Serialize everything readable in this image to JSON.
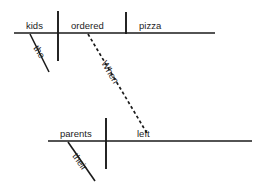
{
  "diagram": {
    "sentence": "When the kids ordered pizza their parents left.",
    "ink_color": "#1a1a1a",
    "background_color": "#ffffff",
    "clauses": [
      {
        "id": "subordinate-clause",
        "baseline": {
          "x1": 14,
          "y1": 33,
          "x2": 215,
          "y2": 33
        },
        "words": [
          {
            "id": "subject",
            "label": "kids",
            "role": "subject",
            "x": 26,
            "y": 29
          },
          {
            "id": "verb",
            "label": "ordered",
            "role": "verb",
            "x": 71,
            "y": 29
          },
          {
            "id": "direct-object",
            "label": "pizza",
            "role": "direct object",
            "x": 139,
            "y": 29
          },
          {
            "id": "article-modifier",
            "label": "the",
            "role": "article modifying subject",
            "x": 33,
            "y": 48,
            "rotation": 57
          }
        ],
        "dividers": [
          {
            "id": "subject-verb-divider",
            "x1": 58,
            "y1": 11,
            "x2": 58,
            "y2": 61
          },
          {
            "id": "verb-object-divider",
            "x1": 126,
            "y1": 12,
            "x2": 126,
            "y2": 34
          }
        ],
        "modifier_lines": [
          {
            "id": "the-slant",
            "x1": 30,
            "y1": 34,
            "x2": 49,
            "y2": 72
          }
        ]
      },
      {
        "id": "main-clause",
        "baseline": {
          "x1": 48,
          "y1": 141,
          "x2": 252,
          "y2": 141
        },
        "words": [
          {
            "id": "subject",
            "label": "parents",
            "role": "subject",
            "x": 60,
            "y": 137
          },
          {
            "id": "verb",
            "label": "left",
            "role": "verb",
            "x": 137,
            "y": 137
          },
          {
            "id": "possessive-modifier",
            "label": "their",
            "role": "possessive adjective modifying subject",
            "x": 72,
            "y": 156,
            "rotation": 55
          }
        ],
        "dividers": [
          {
            "id": "subject-verb-divider",
            "x1": 106,
            "y1": 118,
            "x2": 106,
            "y2": 169
          }
        ],
        "modifier_lines": [
          {
            "id": "their-slant",
            "x1": 68,
            "y1": 142,
            "x2": 95,
            "y2": 181
          }
        ]
      }
    ],
    "connector": {
      "id": "subordinating-conjunction-connector",
      "label": "When",
      "role": "subordinating conjunction",
      "style": "dashed",
      "x1": 88,
      "y1": 34,
      "x2": 148,
      "y2": 135,
      "label_x": 101,
      "label_y": 63,
      "label_rotation": 59
    }
  }
}
